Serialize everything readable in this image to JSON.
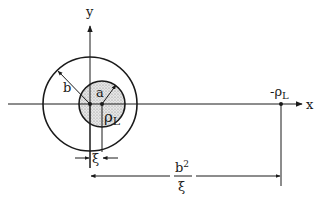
{
  "diagram": {
    "axes": {
      "x_label": "x",
      "y_label": "y"
    },
    "outer_circle": {
      "radius_label": "b"
    },
    "inner_circle": {
      "radius_label": "a",
      "charge_label": "ρ",
      "charge_subscript": "L",
      "fill": "stippled"
    },
    "image_charge": {
      "label_prefix": "-ρ",
      "label_subscript": "L"
    },
    "dimensions": {
      "offset_label": "ξ",
      "image_distance_numerator": "b",
      "image_distance_numerator_sup": "2",
      "image_distance_denominator": "ξ"
    },
    "colors": {
      "line": "#1a1a1a",
      "fill": "#d6d6d6",
      "background": "#ffffff"
    }
  }
}
